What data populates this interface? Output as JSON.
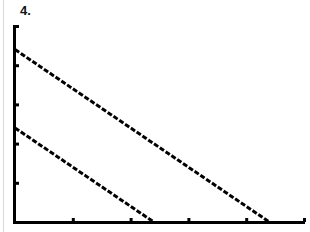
{
  "problem_label": "4.",
  "chart_data": {
    "type": "line",
    "title": "",
    "xlabel": "",
    "ylabel": "",
    "grid": false,
    "xlim": [
      0,
      5
    ],
    "ylim": [
      0,
      5
    ],
    "x_ticks": [
      1,
      2,
      3,
      4,
      5
    ],
    "y_ticks": [
      1,
      2,
      3,
      4,
      5
    ],
    "tick_labels_shown": false,
    "series": [
      {
        "name": "upper line",
        "x": [
          0,
          4.4
        ],
        "y": [
          4.4,
          0
        ]
      },
      {
        "name": "lower line",
        "x": [
          0,
          2.4
        ],
        "y": [
          2.4,
          0
        ]
      }
    ],
    "style": "calculator pixel plot, dashed/stepped black lines"
  }
}
